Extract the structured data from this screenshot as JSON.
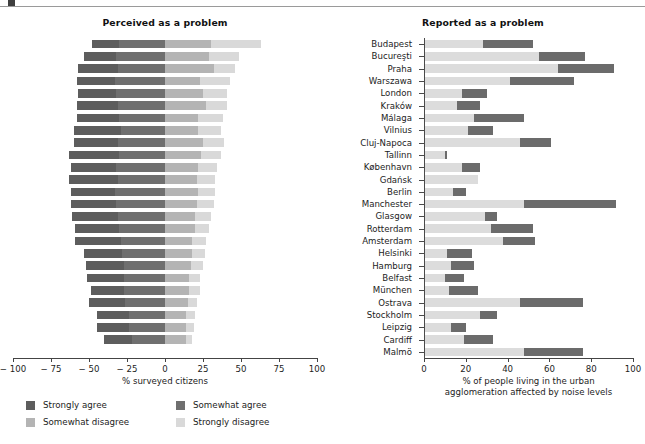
{
  "figure": {
    "top_rule": true
  },
  "left": {
    "title": "Perceived as a problem",
    "axis_label": "% surveyed citizens",
    "ticks": [
      "− 100",
      "− 75",
      "− 50",
      "− 25",
      "0",
      "25",
      "50",
      "75",
      "100"
    ],
    "legend": [
      {
        "label": "Strongly agree",
        "color": "#5d5d5d"
      },
      {
        "label": "Somewhat agree",
        "color": "#6f6f6f"
      },
      {
        "label": "Somewhat disagree",
        "color": "#b4b4b4"
      },
      {
        "label": "Strongly disagree",
        "color": "#d9d9d9"
      }
    ]
  },
  "right": {
    "title": "Reported as a problem",
    "axis_label_line1": "% of people living in the urban",
    "axis_label_line2": "agglomeration affected by noise levels",
    "ticks": [
      "0",
      "20",
      "40",
      "60",
      "80",
      "100"
    ],
    "legend": [
      {
        "label": "55–65 dB",
        "color": "#dcdcdc"
      },
      {
        "label": "Above 65 dB",
        "color": "#6b6b6b"
      }
    ]
  },
  "cities": [
    "Budapest",
    "Bucureşti",
    "Praha",
    "Warszawa",
    "London",
    "Kraków",
    "Málaga",
    "Vilnius",
    "Cluj-Napoca",
    "Tallinn",
    "København",
    "Gdańsk",
    "Berlin",
    "Manchester",
    "Glasgow",
    "Rotterdam",
    "Amsterdam",
    "Helsinki",
    "Hamburg",
    "Belfast",
    "München",
    "Ostrava",
    "Stockholm",
    "Leipzig",
    "Cardiff",
    "Malmö"
  ],
  "chart_data": [
    {
      "type": "bar",
      "orientation": "horizontal",
      "subtype": "diverging-stacked",
      "title": "Perceived as a problem",
      "xlabel": "% surveyed citizens",
      "ylabel": "",
      "xlim": [
        -100,
        100
      ],
      "xticks": [
        -100,
        -75,
        -50,
        -25,
        0,
        25,
        50,
        75,
        100
      ],
      "grid": false,
      "legend_position": "bottom-left",
      "categories": [
        "Budapest",
        "Bucureşti",
        "Praha",
        "Warszawa",
        "London",
        "Kraków",
        "Málaga",
        "Vilnius",
        "Cluj-Napoca",
        "Tallinn",
        "København",
        "Gdańsk",
        "Berlin",
        "Manchester",
        "Glasgow",
        "Rotterdam",
        "Amsterdam",
        "Helsinki",
        "Hamburg",
        "Belfast",
        "München",
        "Ostrava",
        "Stockholm",
        "Leipzig",
        "Cardiff"
      ],
      "series": [
        {
          "name": "Strongly agree",
          "values": [
            18,
            21,
            26,
            25,
            25,
            27,
            28,
            31,
            29,
            33,
            30,
            32,
            29,
            30,
            30,
            29,
            30,
            25,
            25,
            24,
            22,
            24,
            21,
            21,
            18
          ]
        },
        {
          "name": "Somewhat agree",
          "values": [
            30,
            32,
            31,
            33,
            32,
            31,
            30,
            29,
            31,
            30,
            32,
            31,
            33,
            32,
            31,
            30,
            29,
            28,
            27,
            27,
            27,
            26,
            24,
            24,
            22
          ]
        },
        {
          "name": "Somewhat disagree",
          "values": [
            30,
            29,
            32,
            23,
            25,
            27,
            22,
            22,
            25,
            24,
            22,
            21,
            22,
            21,
            20,
            20,
            18,
            18,
            17,
            16,
            16,
            15,
            14,
            14,
            14
          ]
        },
        {
          "name": "Strongly disagree",
          "values": [
            33,
            20,
            14,
            20,
            16,
            14,
            16,
            15,
            14,
            13,
            12,
            12,
            11,
            11,
            10,
            9,
            9,
            8,
            8,
            7,
            7,
            6,
            6,
            5,
            4
          ]
        }
      ],
      "note": "Left two series plotted to the left of zero (negative direction); right two series to the right of zero."
    },
    {
      "type": "bar",
      "orientation": "horizontal",
      "subtype": "stacked",
      "title": "Reported as a problem",
      "xlabel": "% of people living in the urban agglomeration affected by noise levels",
      "ylabel": "",
      "xlim": [
        0,
        100
      ],
      "xticks": [
        0,
        20,
        40,
        60,
        80,
        100
      ],
      "grid": false,
      "legend_position": "bottom",
      "categories": [
        "Budapest",
        "Bucureşti",
        "Praha",
        "Warszawa",
        "London",
        "Kraków",
        "Málaga",
        "Vilnius",
        "Cluj-Napoca",
        "Tallinn",
        "København",
        "Gdańsk",
        "Berlin",
        "Manchester",
        "Glasgow",
        "Rotterdam",
        "Amsterdam",
        "Helsinki",
        "Hamburg",
        "Belfast",
        "München",
        "Ostrava",
        "Stockholm",
        "Leipzig",
        "Cardiff",
        "Malmö"
      ],
      "series": [
        {
          "name": "55–65 dB",
          "values": [
            28,
            55,
            64,
            41,
            18,
            16,
            24,
            21,
            46,
            10,
            18,
            26,
            14,
            48,
            29,
            32,
            38,
            11,
            13,
            10,
            12,
            46,
            27,
            13,
            19,
            48
          ]
        },
        {
          "name": "Above 65 dB",
          "values": [
            24,
            22,
            27,
            31,
            12,
            11,
            24,
            12,
            15,
            1,
            9,
            0,
            6,
            44,
            6,
            20,
            15,
            12,
            11,
            9,
            14,
            30,
            8,
            7,
            14,
            28
          ]
        }
      ]
    }
  ]
}
